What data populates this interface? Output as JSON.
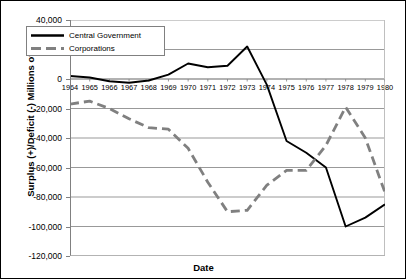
{
  "chart_data": {
    "type": "line",
    "title": "",
    "xlabel": "Date",
    "ylabel": "Surplus (+)/Deficit (-) Millions of Yen",
    "x": [
      1964,
      1965,
      1966,
      1967,
      1968,
      1969,
      1970,
      1971,
      1972,
      1973,
      1974,
      1975,
      1976,
      1977,
      1978,
      1979,
      1980
    ],
    "xtick_labels": [
      "1964",
      "1965",
      "1966",
      "1967",
      "1968",
      "1969",
      "1970",
      "1971",
      "1972",
      "1973",
      "1974",
      "1975",
      "1976",
      "1977",
      "1978",
      "1979",
      "1980"
    ],
    "ytick_labels": [
      "40,000",
      "20,000",
      "0",
      "-20,000",
      "-40,000",
      "-60,000",
      "-80,000",
      "-100,000",
      "-120,000"
    ],
    "ytick_values": [
      40000,
      20000,
      0,
      -20000,
      -40000,
      -60000,
      -80000,
      -100000,
      -120000
    ],
    "ylim": [
      -120000,
      40000
    ],
    "xlim": [
      1964,
      1980
    ],
    "grid": "horizontal",
    "legend_position": "upper-left-inside",
    "series": [
      {
        "name": "Central Government",
        "style": "solid",
        "color": "#000000",
        "values": [
          2000,
          1000,
          -1500,
          -2500,
          -1000,
          3000,
          10500,
          8000,
          9000,
          22000,
          -4000,
          -42000,
          -50000,
          -60000,
          -100000,
          -94000,
          -85000
        ]
      },
      {
        "name": "Corporations",
        "style": "dashed",
        "color": "#808080",
        "values": [
          -17000,
          -15000,
          -20000,
          -27000,
          -33000,
          -34000,
          -47000,
          -70000,
          -90000,
          -89000,
          -72000,
          -62000,
          -62000,
          -45000,
          -19000,
          -40000,
          -77000
        ]
      }
    ]
  },
  "axes": {
    "y_title": "Surplus (+)/Deficit (-) Millions of Yen",
    "x_title": "Date"
  },
  "legend": {
    "items": [
      {
        "label": "Central Government"
      },
      {
        "label": "Corporations"
      }
    ]
  }
}
